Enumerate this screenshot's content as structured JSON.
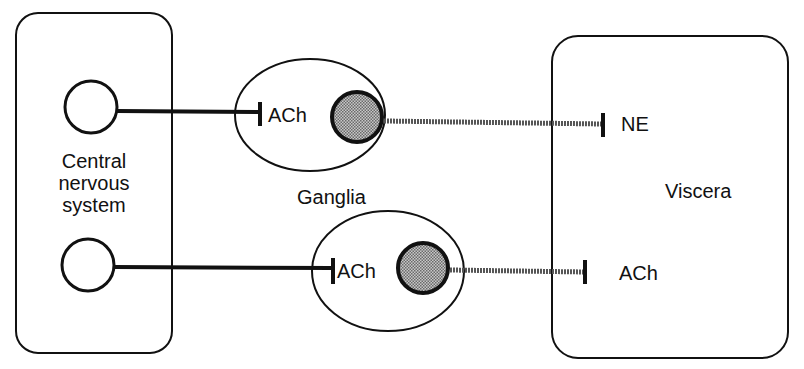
{
  "diagram": {
    "type": "autonomic nervous system pathway",
    "nodes": {
      "cns": {
        "label_line1": "Central",
        "label_line2": "nervous",
        "label_line3": "system"
      },
      "ganglia": {
        "label": "Ganglia"
      },
      "viscera": {
        "label": "Viscera"
      }
    },
    "pathways": [
      {
        "name": "sympathetic",
        "preganglionic_transmitter": "ACh",
        "postganglionic_transmitter": "NE"
      },
      {
        "name": "parasympathetic",
        "preganglionic_transmitter": "ACh",
        "postganglionic_transmitter": "ACh"
      }
    ],
    "colors": {
      "stroke": "#111111",
      "postganglionic_fiber": "#555555",
      "ganglion_cell_fill": "#8a8a8a",
      "background": "#ffffff"
    }
  }
}
